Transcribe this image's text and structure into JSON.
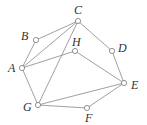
{
  "diagram": {
    "type": "graph",
    "nodes": [
      {
        "id": "A",
        "x": 22,
        "y": 68,
        "lx": 8,
        "ly": 72
      },
      {
        "id": "B",
        "x": 36,
        "y": 40,
        "lx": 21,
        "ly": 40
      },
      {
        "id": "C",
        "x": 78,
        "y": 21,
        "lx": 74,
        "ly": 14
      },
      {
        "id": "D",
        "x": 112,
        "y": 51,
        "lx": 118,
        "ly": 52
      },
      {
        "id": "E",
        "x": 124,
        "y": 83,
        "lx": 131,
        "ly": 89
      },
      {
        "id": "F",
        "x": 87,
        "y": 108,
        "lx": 85,
        "ly": 122
      },
      {
        "id": "G",
        "x": 38,
        "y": 105,
        "lx": 23,
        "ly": 111
      },
      {
        "id": "H",
        "x": 75,
        "y": 51,
        "lx": 72,
        "ly": 46
      }
    ],
    "edges": [
      [
        "C",
        "B"
      ],
      [
        "B",
        "A"
      ],
      [
        "A",
        "C"
      ],
      [
        "A",
        "H"
      ],
      [
        "C",
        "D"
      ],
      [
        "D",
        "E"
      ],
      [
        "H",
        "E"
      ],
      [
        "C",
        "G"
      ],
      [
        "A",
        "G"
      ],
      [
        "G",
        "E"
      ],
      [
        "G",
        "F"
      ],
      [
        "F",
        "E"
      ]
    ]
  }
}
